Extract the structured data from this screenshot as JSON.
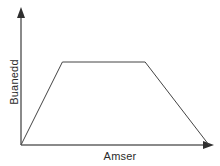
{
  "figure": {
    "background_color": "#ffffff",
    "width": 220,
    "height": 166
  },
  "axes": {
    "x_label": "Amser",
    "y_label": "Buanedd",
    "axis_color": "#808080",
    "arrow_color": "#333333",
    "origin_px": [
      21,
      145
    ],
    "x_axis_end_px": [
      210,
      145
    ],
    "y_axis_top_px": [
      21,
      10
    ]
  },
  "chart_data": {
    "type": "line",
    "title": "",
    "xlabel": "Amser",
    "ylabel": "Buanedd",
    "grid": false,
    "legend": "none",
    "xlim": [
      0,
      10
    ],
    "ylim": [
      0,
      10
    ],
    "axis_ticks": {
      "x": [],
      "y": []
    },
    "series": [
      {
        "name": "Buanedd",
        "color": "#444444",
        "x": [
          0,
          2.2,
          6.6,
          10
        ],
        "y": [
          0,
          6.4,
          6.4,
          0
        ],
        "description": "Trapezium speed-time graph: uniform acceleration, constant speed, uniform deceleration"
      }
    ],
    "segments": [
      {
        "name": "cyflymu",
        "from": [
          0,
          0
        ],
        "to": [
          2.2,
          6.4
        ]
      },
      {
        "name": "buanedd-cyson",
        "from": [
          2.2,
          6.4
        ],
        "to": [
          6.6,
          6.4
        ]
      },
      {
        "name": "arafu",
        "from": [
          6.6,
          6.4
        ],
        "to": [
          10,
          0
        ]
      }
    ],
    "line_color": "#444444",
    "line_width": 1
  }
}
